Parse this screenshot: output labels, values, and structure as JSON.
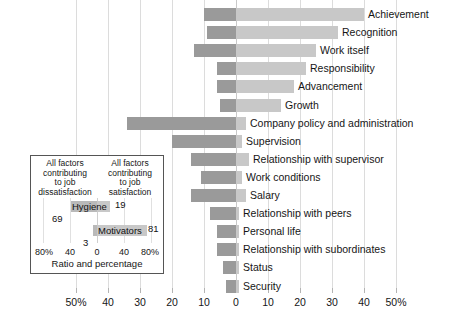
{
  "chart_data": {
    "type": "bar",
    "title": "",
    "subtitle": "",
    "xlabel": "",
    "ylabel": "",
    "orientation": "horizontal-diverging",
    "grid": true,
    "legend_position": "none",
    "xlim": [
      -50,
      50
    ],
    "xticks": [
      -50,
      -40,
      -30,
      -20,
      -10,
      0,
      10,
      20,
      30,
      40,
      50
    ],
    "xtick_labels": [
      "50%",
      "40",
      "30",
      "20",
      "10",
      "0",
      "10",
      "20",
      "30",
      "40",
      "50%"
    ],
    "colors": {
      "dissatisfaction": "#9a9a9a",
      "satisfaction": "#c8c8c8",
      "grid": "#dcdcdc"
    },
    "categories": [
      "Achievement",
      "Recognition",
      "Work itself",
      "Responsibility",
      "Advancement",
      "Growth",
      "Company policy and administration",
      "Supervision",
      "Relationship with supervisor",
      "Work conditions",
      "Salary",
      "Relationship with peers",
      "Personal life",
      "Relationship with subordinates",
      "Status",
      "Security"
    ],
    "series": [
      {
        "name": "Factors characterizing events on the job that led to extreme dissatisfaction",
        "side": "left",
        "values": [
          10,
          9,
          13,
          6,
          6,
          5,
          34,
          20,
          14,
          11,
          14,
          8,
          6,
          6,
          4,
          3
        ]
      },
      {
        "name": "Factors characterizing events on the job that led to extreme satisfaction",
        "side": "right",
        "values": [
          40,
          32,
          25,
          22,
          18,
          14,
          3,
          2,
          4,
          2,
          3,
          1,
          1,
          1,
          1,
          1
        ]
      }
    ]
  },
  "inset": {
    "header_left": "All factors\ncontributing\nto job\ndissatisfaction",
    "header_right": "All factors\ncontributing\nto job\nsatisfaction",
    "axis_title": "Ratio and percentage",
    "xticks": [
      "80%",
      "40",
      "0",
      "40",
      "80%"
    ],
    "bars": [
      {
        "label": "Hygiene",
        "left_value": "69",
        "right_value": "19"
      },
      {
        "label": "Motivators",
        "left_value": "3",
        "right_value": "81"
      }
    ]
  }
}
